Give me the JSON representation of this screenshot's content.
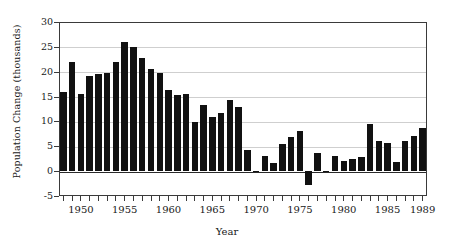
{
  "chart_data": {
    "type": "bar",
    "title": "",
    "xlabel": "Year",
    "ylabel": "Population Change (thousands)",
    "ylim": [
      -5,
      30
    ],
    "yticks": [
      -5,
      0,
      5,
      10,
      15,
      20,
      25,
      30
    ],
    "ytick_labels": [
      "-5",
      "0",
      "5",
      "10",
      "15",
      "20",
      "25",
      "30"
    ],
    "xlim": [
      1947.5,
      1989.5
    ],
    "xtick_labels": [
      "1950",
      "1955",
      "1960",
      "1965",
      "1970",
      "1975",
      "1980",
      "1985",
      "1989"
    ],
    "xtick_values": [
      1950,
      1955,
      1960,
      1965,
      1970,
      1975,
      1980,
      1985,
      1989
    ],
    "grid": true,
    "grid_axis": "y",
    "legend": null,
    "bar_color": "#111111",
    "categories": [
      1948,
      1949,
      1950,
      1951,
      1952,
      1953,
      1954,
      1955,
      1956,
      1957,
      1958,
      1959,
      1960,
      1961,
      1962,
      1963,
      1964,
      1965,
      1966,
      1967,
      1968,
      1969,
      1970,
      1971,
      1972,
      1973,
      1974,
      1975,
      1976,
      1977,
      1978,
      1979,
      1980,
      1981,
      1982,
      1983,
      1984,
      1985,
      1986,
      1987,
      1988,
      1989
    ],
    "values": [
      15.9,
      22.0,
      15.6,
      19.2,
      19.6,
      19.8,
      21.9,
      26.0,
      25.0,
      22.7,
      20.5,
      19.8,
      16.4,
      15.3,
      15.6,
      9.9,
      13.4,
      10.9,
      11.7,
      14.4,
      12.9,
      4.3,
      0.0,
      3.1,
      1.6,
      5.4,
      6.8,
      8.1,
      -2.7,
      3.6,
      -0.2,
      3.1,
      2.1,
      2.4,
      2.9,
      9.5,
      6.1,
      5.6,
      1.8,
      6.0,
      7.1,
      8.7
    ]
  }
}
